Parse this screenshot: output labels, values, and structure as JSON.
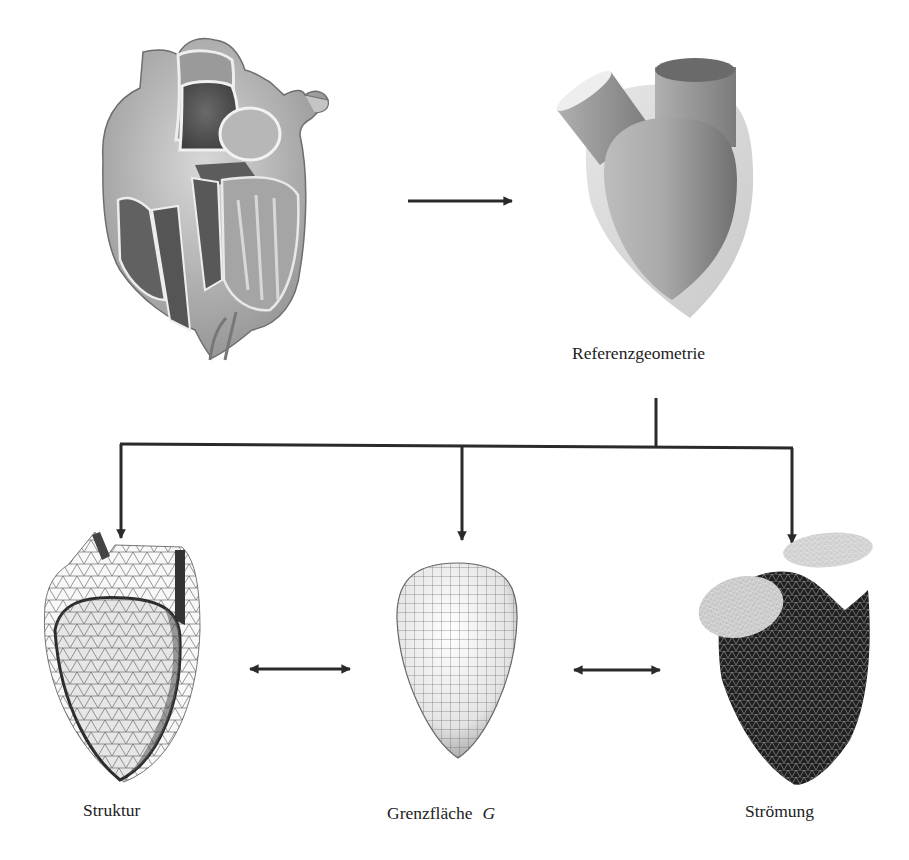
{
  "figure": {
    "type": "flow-diagram",
    "colors": {
      "background": "#ffffff",
      "arrow": "#2a2a2a",
      "text": "#222222",
      "mesh_dark": "#1e1e1e",
      "mesh_light": "#c8c8c8",
      "surface_gray": "#8f8f8f"
    },
    "nodes": {
      "anatomical_heart": {
        "label": ""
      },
      "reference": {
        "label": "Referenzgeometrie"
      },
      "structure": {
        "label": "Struktur"
      },
      "interface": {
        "label": "Grenzfläche",
        "symbol": "G"
      },
      "flow": {
        "label": "Strömung"
      }
    },
    "edges": [
      {
        "from": "anatomical_heart",
        "to": "reference",
        "type": "single-arrow"
      },
      {
        "from": "reference",
        "to": "structure",
        "type": "branch-arrow"
      },
      {
        "from": "reference",
        "to": "interface",
        "type": "branch-arrow"
      },
      {
        "from": "reference",
        "to": "flow",
        "type": "branch-arrow"
      },
      {
        "from": "structure",
        "to": "interface",
        "type": "double-arrow"
      },
      {
        "from": "interface",
        "to": "flow",
        "type": "double-arrow"
      }
    ]
  }
}
